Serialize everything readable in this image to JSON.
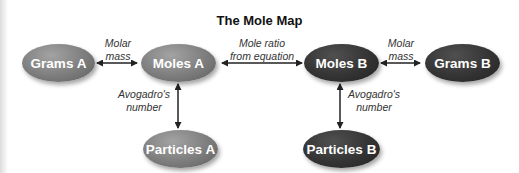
{
  "title": "The Mole Map",
  "nodes": {
    "grams_a": "Grams A",
    "moles_a": "Moles A",
    "moles_b": "Moles B",
    "grams_b": "Grams B",
    "particles_a": "Particles A",
    "particles_b": "Particles B"
  },
  "edges": {
    "grams_a_moles_a": {
      "line1": "Molar",
      "line2": "mass"
    },
    "moles_a_moles_b": {
      "line1": "Mole ratio",
      "line2": "from equation"
    },
    "moles_b_grams_b": {
      "line1": "Molar",
      "line2": "mass"
    },
    "moles_a_particles_a": {
      "line1": "Avogadro's",
      "line2": "number"
    },
    "moles_b_particles_b": {
      "line1": "Avogadro's",
      "line2": "number"
    }
  },
  "colors": {
    "side_a_node": "#7d7d7d",
    "side_b_node": "#343434",
    "text_on_node": "#ffffff",
    "arrow": "#222222"
  }
}
